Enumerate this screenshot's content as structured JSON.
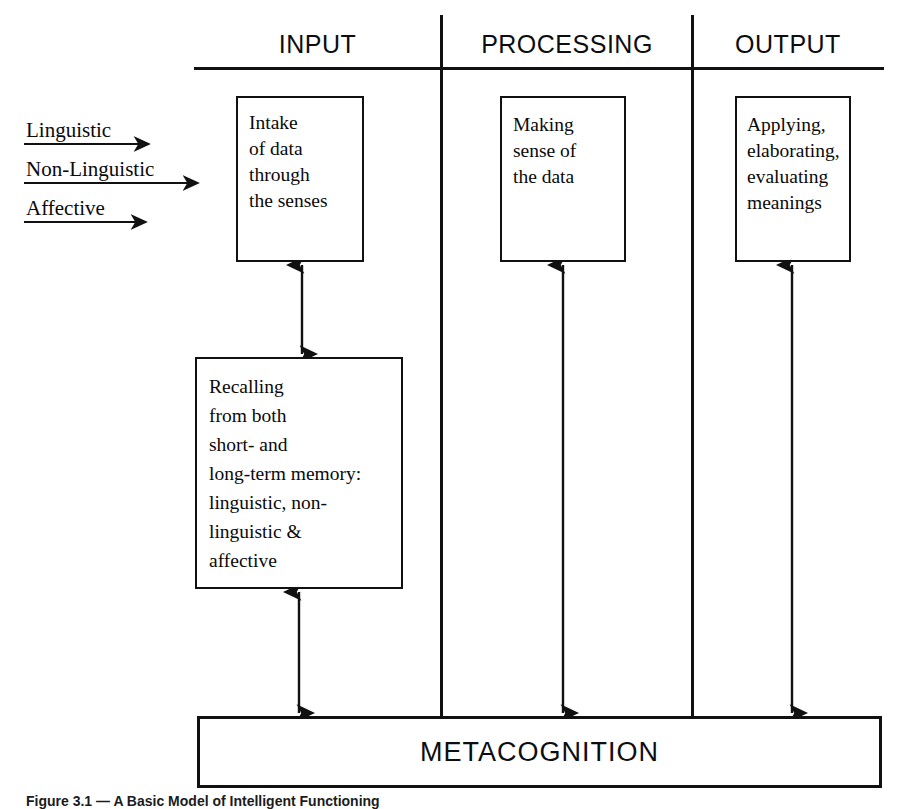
{
  "figure": {
    "caption": "Figure 3.1 — A Basic Model of Intelligent Functioning"
  },
  "columns": [
    {
      "id": "input",
      "label": "INPUT"
    },
    {
      "id": "processing",
      "label": "PROCESSING"
    },
    {
      "id": "output",
      "label": "OUTPUT"
    }
  ],
  "input_streams": [
    {
      "id": "linguistic",
      "label": "Linguistic"
    },
    {
      "id": "non-linguistic",
      "label": "Non-Linguistic"
    },
    {
      "id": "affective",
      "label": "Affective"
    }
  ],
  "nodes": {
    "intake": {
      "text": "Intake\nof data\nthrough\nthe senses"
    },
    "recalling": {
      "text": "Recalling\nfrom both\nshort- and\nlong-term memory:\nlinguistic, non-\nlinguistic &\naffective"
    },
    "making": {
      "text": "Making\nsense of\nthe data"
    },
    "applying": {
      "text": "Applying,\nelaborating,\nevaluating\nmeanings"
    }
  },
  "metacognition": {
    "label": "METACOGNITION"
  },
  "style": {
    "ink": "#111111",
    "paper": "#ffffff"
  }
}
